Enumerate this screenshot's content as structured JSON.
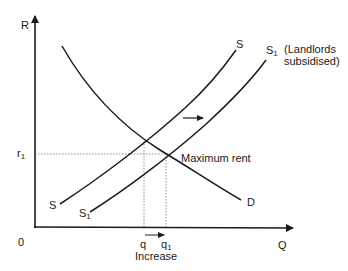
{
  "diagram": {
    "type": "supply-demand",
    "axes": {
      "y_label": "R",
      "x_label": "Q",
      "origin_label": "0"
    },
    "curves": [
      {
        "id": "S",
        "label": "S",
        "sub": "",
        "role": "original supply"
      },
      {
        "id": "S1",
        "label": "S",
        "sub": "1",
        "role": "supply after subsidy"
      },
      {
        "id": "D",
        "label": "D",
        "sub": "",
        "role": "demand"
      }
    ],
    "annotations": {
      "s1_note_line1": "(Landlords",
      "s1_note_line2": "subsidised)",
      "max_rent": "Maximum rent",
      "r1_label": "r",
      "r1_sub": "1",
      "q_label": "q",
      "q1_label": "q",
      "q1_sub": "1",
      "increase": "Increase"
    },
    "shift_arrow": "rightward shift of supply"
  }
}
